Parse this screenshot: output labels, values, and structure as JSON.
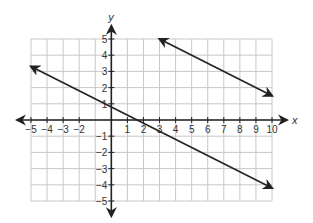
{
  "chart_data": {
    "type": "line",
    "title": "",
    "xlabel": "x",
    "ylabel": "y",
    "xlim": [
      -5,
      10
    ],
    "ylim": [
      -5,
      5
    ],
    "grid": true,
    "x_ticks": [
      -5,
      -4,
      -3,
      -2,
      1,
      2,
      3,
      4,
      5,
      6,
      7,
      8,
      9,
      10
    ],
    "y_ticks": [
      5,
      4,
      3,
      2,
      1,
      -1,
      -2,
      -3,
      -4,
      -5
    ],
    "series": [
      {
        "name": "upper line",
        "x": [
          3,
          10
        ],
        "y": [
          5,
          1.5
        ],
        "equation": "y = -0.5x + 6.5",
        "arrows": "both"
      },
      {
        "name": "lower line",
        "x": [
          -5,
          10
        ],
        "y": [
          3.3,
          -4.2
        ],
        "equation": "y = -0.5x + 0.8",
        "arrows": "both"
      }
    ],
    "colors": {
      "grid": "#c8c8c8",
      "axis": "#222222",
      "line": "#222222"
    }
  }
}
